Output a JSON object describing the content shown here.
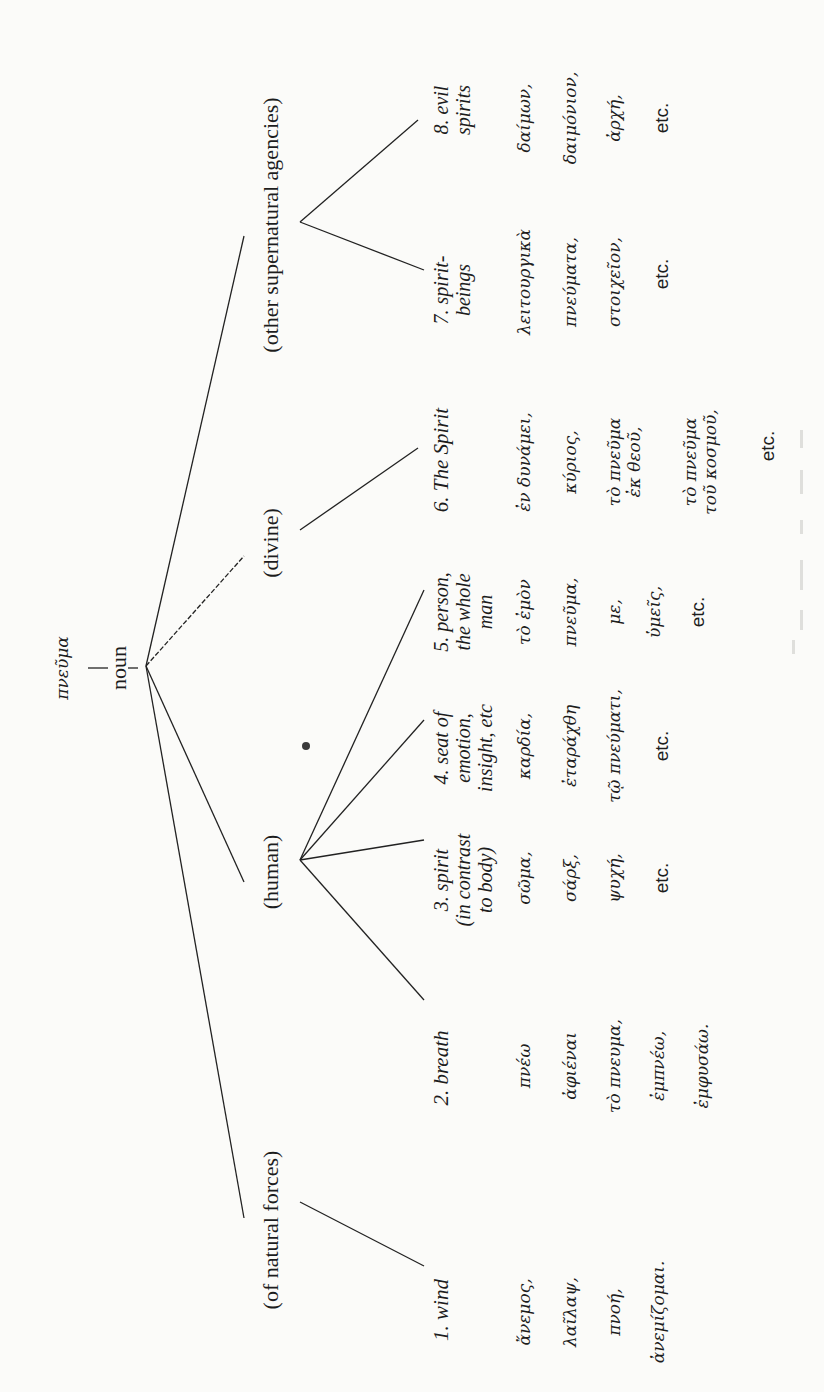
{
  "diagram": {
    "orientation": "rotated 90deg counter-clockwise",
    "root": {
      "word": "πνεῦμα",
      "pos": "noun"
    },
    "groups": [
      {
        "label": "(of natural forces)"
      },
      {
        "label": "(human)"
      },
      {
        "label": "(divine)"
      },
      {
        "label": "(other supernatural agencies)"
      }
    ],
    "senses": [
      {
        "number": "1.",
        "label_lines": [
          "1. wind"
        ],
        "group": "(of natural forces)",
        "words": [
          "ἄνεμος,",
          "λαῖλαψ,",
          "πνοή,",
          "ἀνεμίζομαι."
        ]
      },
      {
        "number": "2.",
        "label_lines": [
          "2. breath"
        ],
        "group": "(human)",
        "words": [
          "πνέω",
          "ἀφιέναι",
          "τὸ πνευμα,",
          "ἐμπνέω,",
          "ἐμφυσάω."
        ]
      },
      {
        "number": "3.",
        "label_lines": [
          "3. spirit",
          "(in contrast",
          "to body)"
        ],
        "group": "(human)",
        "words": [
          "σῶμα,",
          "σάρξ,",
          "ψυχή,",
          "etc."
        ]
      },
      {
        "number": "4.",
        "label_lines": [
          "4. seat of",
          "emotion,",
          "insight, etc"
        ],
        "group": "(human)",
        "words": [
          "καρδία,",
          "ἐταράχθη",
          "τῷ πνεύματι,",
          "etc."
        ]
      },
      {
        "number": "5.",
        "label_lines": [
          "5. person,",
          "the whole",
          "man"
        ],
        "group": "(human)",
        "words": [
          "τὸ ἐμὸν",
          "πνεῦμα,",
          "με,",
          "ὑμεῖς,",
          "etc."
        ]
      },
      {
        "number": "6.",
        "label_lines": [
          "6. The Spirit"
        ],
        "group": "(divine)",
        "words": [
          "ἐν δυνάμει,",
          "κύριος,",
          "τὸ πνεῦμα",
          "ἐκ θεοῦ,",
          "τὸ πνεῦμα",
          "τοῦ κοσμοῦ,",
          "etc."
        ]
      },
      {
        "number": "7.",
        "label_lines": [
          "7. spirit-",
          "beings"
        ],
        "group": "(other supernatural agencies)",
        "words": [
          "λειτουργικὰ",
          "πνεύματα,",
          "στοιχεῖον,",
          "etc."
        ]
      },
      {
        "number": "8.",
        "label_lines": [
          "8. evil",
          "spirits"
        ],
        "group": "(other supernatural agencies)",
        "words": [
          "δαίμων,",
          "δαιμόνιον,",
          "ἀρχή,",
          "etc."
        ]
      }
    ]
  }
}
